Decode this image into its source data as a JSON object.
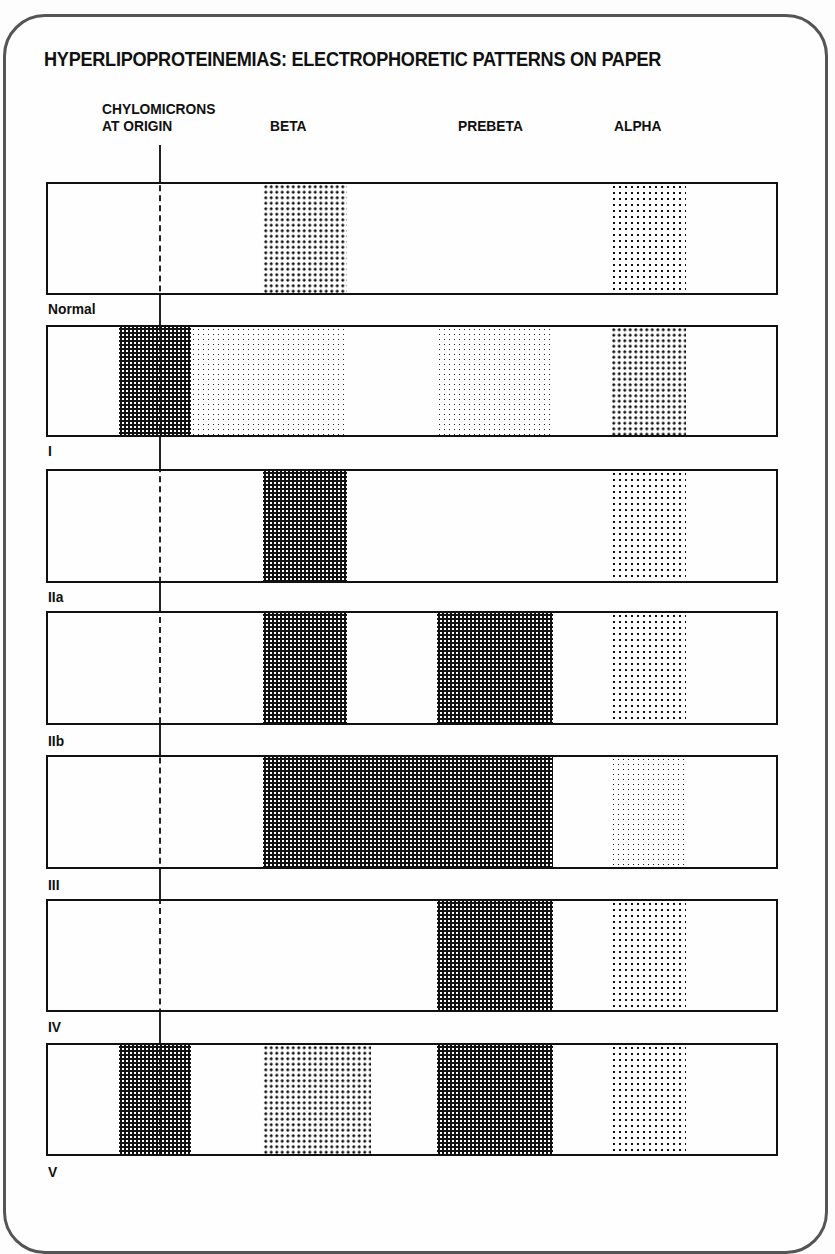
{
  "title": "HYPERLIPOPROTEINEMIAS: ELECTROPHORETIC PATTERNS ON PAPER",
  "columns": {
    "origin_line1": "CHYLOMICRONS",
    "origin_line2": "AT ORIGIN",
    "beta": "BETA",
    "prebeta": "PREBETA",
    "alpha": "ALPHA"
  },
  "rows": [
    {
      "label": "Normal",
      "bands": {
        "chylomicrons": "none",
        "beta": "moderate",
        "prebeta": "none",
        "alpha": "moderate"
      }
    },
    {
      "label": "I",
      "bands": {
        "chylomicrons": "heavy",
        "beta": "faint-broad",
        "prebeta": "faint",
        "alpha": "moderate"
      }
    },
    {
      "label": "IIa",
      "bands": {
        "chylomicrons": "none",
        "beta": "heavy",
        "prebeta": "none",
        "alpha": "moderate"
      }
    },
    {
      "label": "IIb",
      "bands": {
        "chylomicrons": "none",
        "beta": "heavy",
        "prebeta": "heavy",
        "alpha": "moderate"
      }
    },
    {
      "label": "III",
      "bands": {
        "chylomicrons": "none",
        "beta-prebeta-broad": "heavy",
        "alpha": "light"
      }
    },
    {
      "label": "IV",
      "bands": {
        "chylomicrons": "none",
        "beta": "none",
        "prebeta": "heavy",
        "alpha": "moderate"
      }
    },
    {
      "label": "V",
      "bands": {
        "chylomicrons": "heavy",
        "beta": "light",
        "prebeta": "heavy",
        "alpha": "moderate"
      }
    }
  ]
}
